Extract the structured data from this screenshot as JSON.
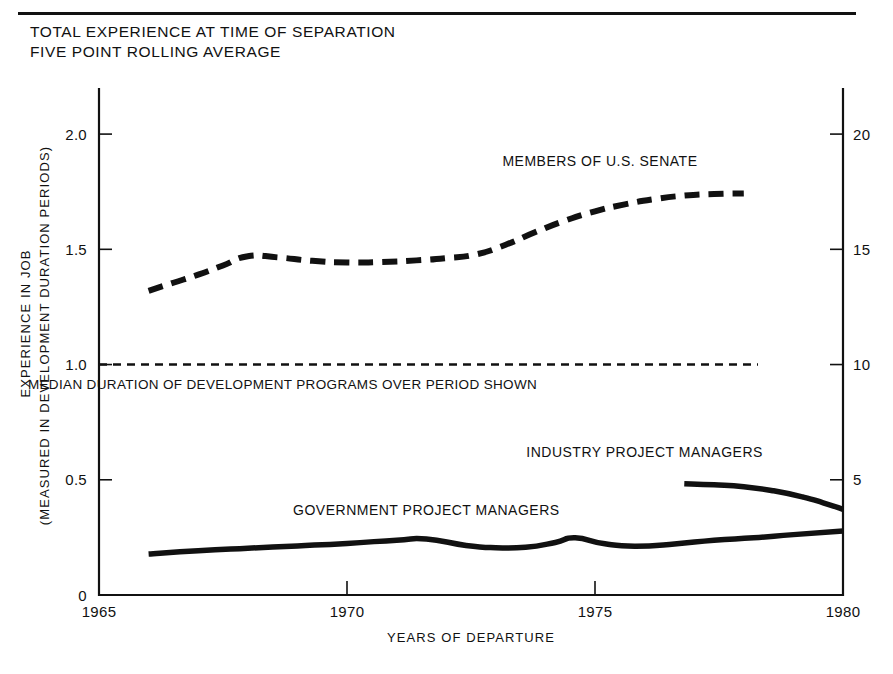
{
  "figure": {
    "title_lines": [
      "TOTAL EXPERIENCE AT TIME OF SEPARATION",
      "FIVE POINT ROLLING AVERAGE"
    ],
    "background": "#ffffff",
    "ink_color": "#111111"
  },
  "chart_data": {
    "type": "line",
    "title": "TOTAL EXPERIENCE AT TIME OF SEPARATION FIVE POINT ROLLING AVERAGE",
    "subtitle": "FIVE POINT ROLLING AVERAGE",
    "xlabel": "YEARS OF DEPARTURE",
    "ylabel": "EXPERIENCE IN JOB",
    "ylabel_second_line": "(MEASURED IN DEVELOPMENT DURATION PERIODS)",
    "xlim": [
      1965,
      1980
    ],
    "ylim": [
      0,
      2.2
    ],
    "xticks": [
      1965,
      1970,
      1975,
      1980
    ],
    "xticklabels": [
      "1965",
      "1970",
      "1975",
      "1980"
    ],
    "yticks": [
      0,
      0.5,
      1.0,
      1.5,
      2.0
    ],
    "yticklabels": [
      "0",
      "0.5",
      "1.0",
      "1.5",
      "2.0"
    ],
    "y2label": "",
    "y2lim": [
      0,
      22
    ],
    "y2ticks": [
      5,
      10,
      15,
      20
    ],
    "y2ticklabels": [
      "5",
      "10",
      "15",
      "20"
    ],
    "grid": false,
    "legend_position": "inline-annotations",
    "series": [
      {
        "name": "MEMBERS OF U.S. SENATE",
        "style": "dashed",
        "label_x": 1975.1,
        "label_y": 1.86,
        "x": [
          1966.0,
          1966.5,
          1967.0,
          1967.5,
          1968.0,
          1968.6,
          1969.3,
          1970.0,
          1970.7,
          1971.4,
          1972.0,
          1972.6,
          1973.2,
          1973.8,
          1974.4,
          1975.0,
          1975.6,
          1976.2,
          1976.8,
          1977.4,
          1978.0
        ],
        "y": [
          1.32,
          1.355,
          1.39,
          1.43,
          1.47,
          1.465,
          1.45,
          1.443,
          1.445,
          1.452,
          1.462,
          1.478,
          1.52,
          1.575,
          1.625,
          1.665,
          1.695,
          1.718,
          1.733,
          1.74,
          1.742
        ]
      },
      {
        "name": "GOVERNMENT PROJECT MANAGERS",
        "style": "solid",
        "label_x": 1971.6,
        "label_y": 0.345,
        "x": [
          1966.0,
          1967.0,
          1968.0,
          1969.0,
          1970.0,
          1971.0,
          1971.6,
          1972.4,
          1973.0,
          1973.6,
          1974.2,
          1974.6,
          1975.2,
          1975.8,
          1976.6,
          1977.4,
          1978.2,
          1979.0,
          1980.0
        ],
        "y": [
          0.178,
          0.192,
          0.203,
          0.213,
          0.224,
          0.238,
          0.243,
          0.215,
          0.205,
          0.207,
          0.228,
          0.248,
          0.222,
          0.212,
          0.221,
          0.238,
          0.248,
          0.262,
          0.278
        ]
      },
      {
        "name": "INDUSTRY PROJECT MANAGERS",
        "style": "solid",
        "label_x": 1976.0,
        "label_y": 0.6,
        "x": [
          1976.8,
          1977.4,
          1978.0,
          1978.6,
          1979.2,
          1979.6,
          1980.0
        ],
        "y": [
          0.483,
          0.478,
          0.47,
          0.452,
          0.425,
          0.4,
          0.372
        ]
      }
    ],
    "reference_line": {
      "name": "MEDIAN DURATION OF DEVELOPMENT PROGRAMS OVER PERIOD SHOWN",
      "value": 1.0,
      "style": "dotted",
      "label": "MEDIAN DURATION OF DEVELOPMENT PROGRAMS OVER PERIOD SHOWN",
      "label_x": 1968.7,
      "label_y": 0.895
    }
  }
}
